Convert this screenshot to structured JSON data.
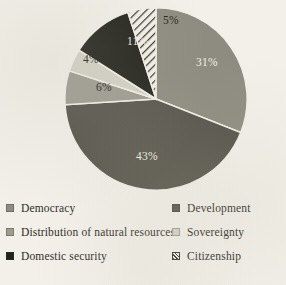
{
  "chart_data": {
    "type": "pie",
    "title": "",
    "subtitle": "",
    "xlabel": "",
    "ylabel": "",
    "grid": false,
    "legend_position": "bottom",
    "legend_columns": 2,
    "start_angle_deg": 0,
    "direction": "clockwise",
    "units": "percent",
    "categories": [
      "Democracy",
      "Development",
      "Distribution of natural resources",
      "Sovereignty",
      "Domestic security",
      "Citizenship"
    ],
    "values": [
      31,
      43,
      6,
      4,
      11,
      5
    ],
    "total": 100,
    "slices": [
      {
        "label": "Democracy",
        "value": 31,
        "data_label": "31%",
        "color": "#8e8c80",
        "fill": "solid",
        "label_color": "#efece2"
      },
      {
        "label": "Development",
        "value": 43,
        "data_label": "43%",
        "color": "#56544b",
        "fill": "solid",
        "label_color": "#efece2"
      },
      {
        "label": "Distribution of natural resources",
        "value": 6,
        "data_label": "6%",
        "color": "#9e9c91",
        "fill": "solid",
        "label_color": "#26261f"
      },
      {
        "label": "Sovereignty",
        "value": 4,
        "data_label": "4%",
        "color": "#d4d2c7",
        "fill": "solid",
        "label_color": "#26261f"
      },
      {
        "label": "Domestic security",
        "value": 11,
        "data_label": "11%",
        "color": "#23231d",
        "fill": "solid",
        "label_color": "#efece2"
      },
      {
        "label": "Citizenship",
        "value": 5,
        "data_label": "5%",
        "color": "#35342c",
        "fill": "diagonal-hatch",
        "label_color": "#26261f"
      }
    ]
  },
  "legend": {
    "left_column": [
      {
        "label": "Democracy",
        "swatch": "#8e8c80",
        "fill": "solid"
      },
      {
        "label": "Distribution of natural resources",
        "swatch": "#9e9c91",
        "fill": "solid"
      },
      {
        "label": "Domestic security",
        "swatch": "#23231d",
        "fill": "solid"
      }
    ],
    "right_column": [
      {
        "label": "Development",
        "swatch": "#56544b",
        "fill": "solid"
      },
      {
        "label": "Sovereignty",
        "swatch": "#d4d2c7",
        "fill": "solid"
      },
      {
        "label": "Citizenship",
        "swatch": "#35342c",
        "fill": "diagonal-hatch"
      }
    ]
  },
  "page": {
    "background_color": "#f2f0e9",
    "text_color": "#2b2b28"
  }
}
